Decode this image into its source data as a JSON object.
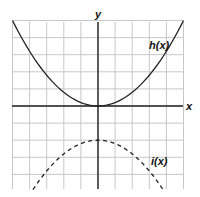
{
  "chart_data": {
    "type": "line",
    "title": "",
    "xlabel": "x",
    "ylabel": "y",
    "xlim": [
      -5,
      5
    ],
    "ylim": [
      -4.9,
      5
    ],
    "grid": true,
    "grid_unit": 1,
    "series": [
      {
        "name": "h(x)",
        "style": "solid",
        "equation": "h(x) = x^2 / 5",
        "vertex": [
          0,
          0
        ],
        "points": [
          [
            -5,
            5
          ],
          [
            -4,
            3.2
          ],
          [
            -3,
            1.8
          ],
          [
            -2,
            0.8
          ],
          [
            -1,
            0.2
          ],
          [
            0,
            0
          ],
          [
            1,
            0.2
          ],
          [
            2,
            0.8
          ],
          [
            3,
            1.8
          ],
          [
            4,
            3.2
          ],
          [
            5,
            5
          ]
        ]
      },
      {
        "name": "i(x)",
        "style": "dashed",
        "equation": "i(x) = -x^2 / 5 - 2",
        "vertex": [
          0,
          -2
        ],
        "points": [
          [
            -3.8,
            -4.9
          ],
          [
            -3,
            -3.8
          ],
          [
            -2,
            -2.8
          ],
          [
            -1,
            -2.2
          ],
          [
            0,
            -2
          ],
          [
            1,
            -2.2
          ],
          [
            2,
            -2.8
          ],
          [
            3,
            -3.8
          ],
          [
            3.8,
            -4.9
          ]
        ]
      }
    ],
    "annotations": [
      {
        "text": "h(x)",
        "at": [
          4.3,
          3.0
        ]
      },
      {
        "text": "i(x)",
        "at": [
          3.4,
          -3.4
        ]
      }
    ]
  },
  "labels": {
    "x_axis": "x",
    "y_axis": "y",
    "h": "h(x)",
    "i": "i(x)"
  },
  "colors": {
    "grid": "#c8c8c8",
    "axis": "#222222",
    "curve": "#222222"
  }
}
